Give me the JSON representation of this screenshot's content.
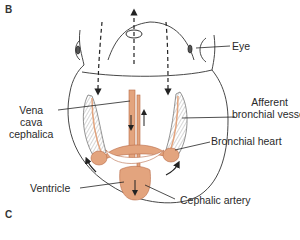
{
  "panels": {
    "top": "B",
    "bottom": "C"
  },
  "labels": {
    "eye": "Eye",
    "afferent_line1": "Afferent",
    "afferent_line2": "bronchial vessel",
    "vena_line1": "Vena",
    "vena_line2": "cava",
    "vena_line3": "cephalica",
    "bronchial_heart": "Bronchial heart",
    "ventricle": "Ventricle",
    "cephalic_artery": "Cephalic artery"
  },
  "colors": {
    "vessel": "#e3a47e",
    "vessel_stroke": "#b86c48",
    "outline": "#333333",
    "gill": "#9a9a9a"
  }
}
